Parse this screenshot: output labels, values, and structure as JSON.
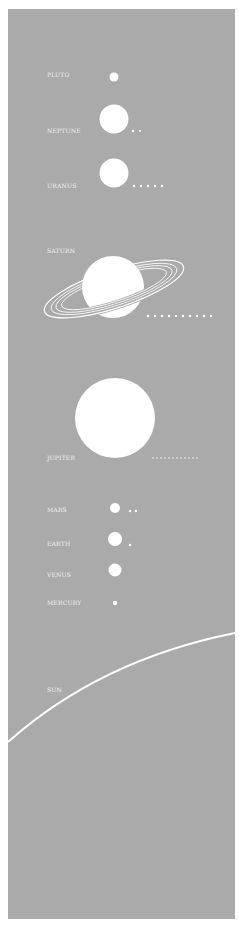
{
  "diagram": {
    "type": "solar-system-size-comparison",
    "background_color": "#aaaaaa",
    "foreground_color": "#ffffff",
    "bodies": [
      {
        "name": "PLUTO",
        "moons": 0
      },
      {
        "name": "NEPTUNE",
        "moons": 2
      },
      {
        "name": "URANUS",
        "moons": 5
      },
      {
        "name": "SATURN",
        "moons": 10
      },
      {
        "name": "JUPITER",
        "moons": 12
      },
      {
        "name": "MARS",
        "moons": 2
      },
      {
        "name": "EARTH",
        "moons": 1
      },
      {
        "name": "VENUS",
        "moons": 0
      },
      {
        "name": "MERCURY",
        "moons": 0
      },
      {
        "name": "SUN",
        "moons": 0
      }
    ]
  }
}
